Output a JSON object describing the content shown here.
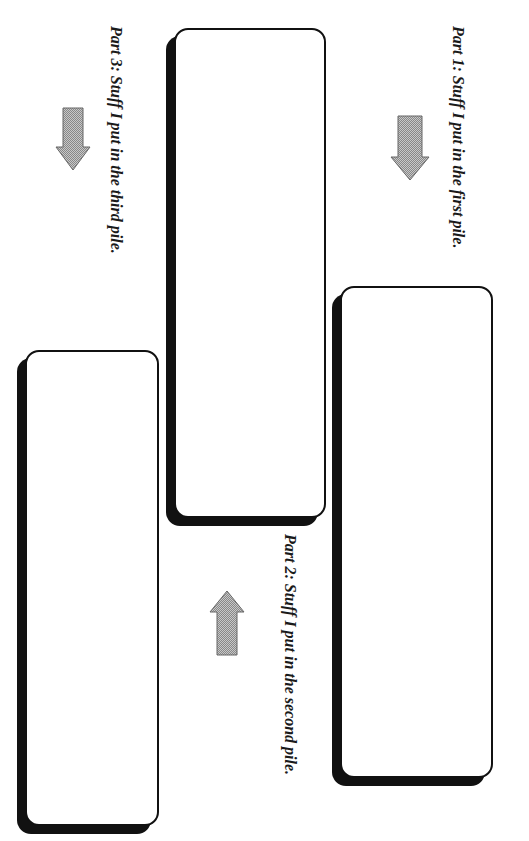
{
  "parts": [
    {
      "id": "part1",
      "label": "Part 1:  Stuff I put in the first pile.",
      "arrow_direction": "down"
    },
    {
      "id": "part2",
      "label": "Part 2: Stuff I put in the second pile.",
      "arrow_direction": "up"
    },
    {
      "id": "part3",
      "label": "Part 3: Stuff I put in the third pile.",
      "arrow_direction": "down"
    }
  ],
  "colors": {
    "border": "#111111",
    "arrow_fill": "#a8a8a8",
    "arrow_stroke": "#666666",
    "text": "#1a1a1a"
  },
  "icons": {
    "arrow_down": "down-arrow-icon",
    "arrow_up": "up-arrow-icon"
  }
}
